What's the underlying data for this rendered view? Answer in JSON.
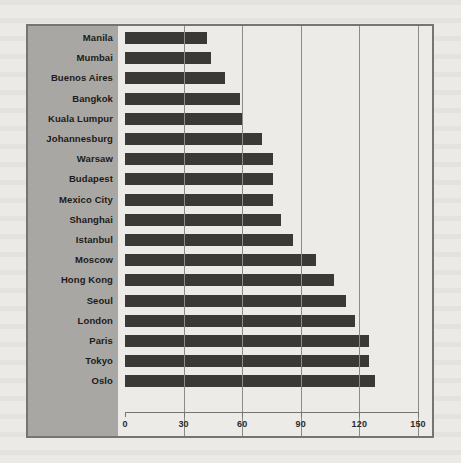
{
  "chart_data": {
    "type": "bar",
    "orientation": "horizontal",
    "title": "",
    "subtitle": "",
    "xlabel": "",
    "ylabel": "",
    "xlim": [
      0,
      150
    ],
    "xticks": [
      0,
      30,
      60,
      90,
      120,
      150
    ],
    "grid": true,
    "legend": null,
    "categories": [
      "Manila",
      "Mumbai",
      "Buenos Aires",
      "Bangkok",
      "Kuala Lumpur",
      "Johannesburg",
      "Warsaw",
      "Budapest",
      "Mexico City",
      "Shanghai",
      "Istanbul",
      "Moscow",
      "Hong Kong",
      "Seoul",
      "London",
      "Paris",
      "Tokyo",
      "Oslo"
    ],
    "values": [
      42,
      44,
      51,
      59,
      60,
      70,
      76,
      76,
      76,
      80,
      86,
      98,
      107,
      113,
      118,
      125,
      125,
      128
    ]
  },
  "style": {
    "bar_color": "#3a3936",
    "panel_color": "#a9a7a3",
    "plot_background": "#edebe7",
    "frame_color": "#77756f",
    "gridline_color": "#8d8b86",
    "text_color": "#1c1b1a"
  }
}
